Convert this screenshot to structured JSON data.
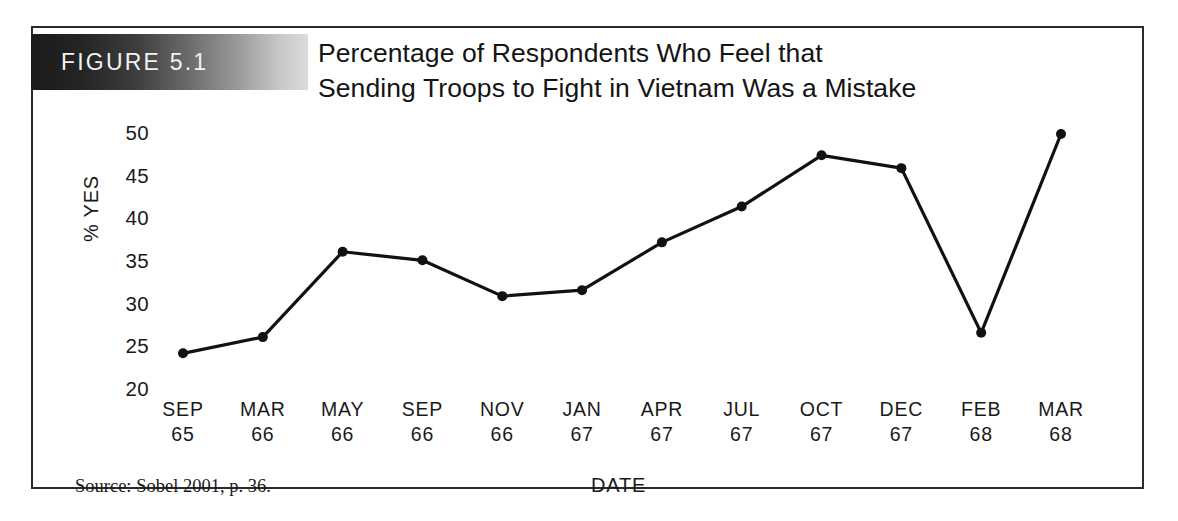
{
  "figure": {
    "badge_label": "FIGURE 5.1",
    "title_line1": "Percentage of Respondents Who Feel that",
    "title_line2": "Sending Troops to Fight in Vietnam Was a Mistake",
    "source_note": "Source: Sobel 2001, p. 36.",
    "badge_gradient_start": "#1b1b1b",
    "badge_gradient_end": "#dcdcdc",
    "frame_color": "#2b2b2b",
    "line_color": "#111111"
  },
  "chart_data": {
    "type": "line",
    "title": "Percentage of Respondents Who Feel that Sending Troops to Fight in Vietnam Was a Mistake",
    "xlabel": "DATE",
    "ylabel": "% YES",
    "ylim": [
      20,
      50
    ],
    "yticks": [
      50,
      45,
      40,
      35,
      30,
      25,
      20
    ],
    "ytick_labels": [
      "50",
      "45",
      "40",
      "35",
      "30",
      "25",
      "20"
    ],
    "grid": false,
    "legend": "none",
    "marker": "circle",
    "categories": [
      "SEP 65",
      "MAR 66",
      "MAY 66",
      "SEP 66",
      "NOV 66",
      "JAN 67",
      "APR 67",
      "JUL 67",
      "OCT 67",
      "DEC 67",
      "FEB 68",
      "MAR 68"
    ],
    "xtick_months": [
      "SEP",
      "MAR",
      "MAY",
      "SEP",
      "NOV",
      "JAN",
      "APR",
      "JUL",
      "OCT",
      "DEC",
      "FEB",
      "MAR"
    ],
    "xtick_years": [
      "65",
      "66",
      "66",
      "66",
      "66",
      "67",
      "67",
      "67",
      "67",
      "67",
      "68",
      "68"
    ],
    "values": [
      24.3,
      26.2,
      36.2,
      35.2,
      31.0,
      31.7,
      37.3,
      41.5,
      47.5,
      46.0,
      26.7,
      50.0
    ],
    "series": [
      {
        "name": "% YES",
        "values": [
          24.3,
          26.2,
          36.2,
          35.2,
          31.0,
          31.7,
          37.3,
          41.5,
          47.5,
          46.0,
          26.7,
          50.0
        ]
      }
    ]
  }
}
